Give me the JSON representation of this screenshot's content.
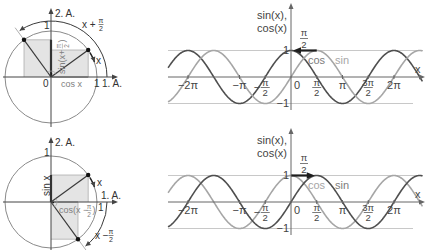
{
  "figure": {
    "top_circle": {
      "axis_x_label": "1. A.",
      "axis_y_label": "2. A.",
      "unit_y_label": "1",
      "unit_x_label": "1",
      "origin_label": "0",
      "angle_label": "x",
      "shifted_angle_prefix": "x +",
      "shifted_angle_num": "π",
      "shifted_angle_den": "2",
      "projection_x_label": "cos x",
      "projection_y_prefix": "sin(x+",
      "projection_y_num": "π",
      "projection_y_den": "2",
      "projection_y_suffix": ")"
    },
    "bottom_circle": {
      "axis_x_label": "1. A.",
      "axis_y_label": "2. A.",
      "unit_y_label": "1",
      "unit_x_label": "1",
      "angle_label": "x",
      "shifted_angle_prefix": "x −",
      "shifted_angle_num": "π",
      "shifted_angle_den": "2",
      "projection_y_label": "sin x",
      "projection_x_prefix": "cos(x −",
      "projection_x_num": "π",
      "projection_x_den": "2",
      "projection_x_suffix": ")"
    }
  },
  "colors": {
    "curve_dark": "#4f4f4f",
    "curve_light": "#a6a6a6",
    "axis": "#444444",
    "grid": "#c8c8c8",
    "shade": "#e4e4e4",
    "annotation_arrow": "#1e1e1e"
  },
  "chart_data": [
    {
      "type": "line",
      "title": "",
      "ylabel": "sin(x), cos(x)",
      "ylabel_lines": [
        "sin(x),",
        "cos(x)"
      ],
      "xlabel": "x",
      "x_range": [
        -7.5,
        8.05
      ],
      "ylim": [
        -1,
        1
      ],
      "grid": {
        "horizontal_lines": [
          1,
          -1
        ]
      },
      "y_ticks": [
        {
          "value": 1,
          "label": "1"
        },
        {
          "value": -1,
          "label": "−1"
        }
      ],
      "x_ticks": [
        {
          "value": -6.2832,
          "label": "−2π"
        },
        {
          "value": -3.1416,
          "label": "−π"
        },
        {
          "value": -1.5708,
          "sign": "−",
          "num": "π",
          "den": "2"
        },
        {
          "value": 0,
          "label": "0"
        },
        {
          "value": 1.5708,
          "num": "π",
          "den": "2"
        },
        {
          "value": 3.1416,
          "label": "π"
        },
        {
          "value": 4.7124,
          "num": "3π",
          "den": "2"
        },
        {
          "value": 6.2832,
          "label": "2π"
        }
      ],
      "series": [
        {
          "name": "cos",
          "function": "cos",
          "label": "cos",
          "color": "#4f4f4f",
          "label_color": "#7c7c7c",
          "x": [
            -6.2832,
            -4.7124,
            -3.1416,
            -1.5708,
            0,
            1.5708,
            3.1416,
            4.7124,
            6.2832
          ],
          "values": [
            1,
            0,
            -1,
            0,
            1,
            0,
            -1,
            0,
            1
          ]
        },
        {
          "name": "sin",
          "function": "sin",
          "label": "sin",
          "color": "#a6a6a6",
          "label_color": "#a6a6a6",
          "x": [
            -6.2832,
            -4.7124,
            -3.1416,
            -1.5708,
            0,
            1.5708,
            3.1416,
            4.7124,
            6.2832
          ],
          "values": [
            0,
            1,
            0,
            -1,
            0,
            1,
            0,
            -1,
            0
          ]
        }
      ],
      "annotation": {
        "type": "arrow",
        "from_x": 1.5708,
        "to_x": 0,
        "y": 1,
        "label_num": "π",
        "label_den": "2",
        "color": "#1e1e1e"
      }
    },
    {
      "type": "line",
      "title": "",
      "ylabel": "sin(x), cos(x)",
      "ylabel_lines": [
        "sin(x),",
        "cos(x)"
      ],
      "xlabel": "x",
      "x_range": [
        -7.5,
        8.05
      ],
      "ylim": [
        -1,
        1
      ],
      "grid": {
        "horizontal_lines": [
          1,
          -1
        ]
      },
      "y_ticks": [
        {
          "value": 1,
          "label": "1"
        },
        {
          "value": -1,
          "label": "−1"
        }
      ],
      "x_ticks": [
        {
          "value": -6.2832,
          "label": "−2π"
        },
        {
          "value": -3.1416,
          "label": "−π"
        },
        {
          "value": -1.5708,
          "sign": "−",
          "num": "π",
          "den": "2"
        },
        {
          "value": 0,
          "label": "0"
        },
        {
          "value": 1.5708,
          "num": "π",
          "den": "2"
        },
        {
          "value": 3.1416,
          "label": "π"
        },
        {
          "value": 4.7124,
          "num": "3π",
          "den": "2"
        },
        {
          "value": 6.2832,
          "label": "2π"
        }
      ],
      "series": [
        {
          "name": "cos",
          "function": "cos",
          "label": "cos",
          "color": "#a6a6a6",
          "label_color": "#a6a6a6",
          "x": [
            -6.2832,
            -4.7124,
            -3.1416,
            -1.5708,
            0,
            1.5708,
            3.1416,
            4.7124,
            6.2832
          ],
          "values": [
            1,
            0,
            -1,
            0,
            1,
            0,
            -1,
            0,
            1
          ]
        },
        {
          "name": "sin",
          "function": "sin",
          "label": "sin",
          "color": "#4f4f4f",
          "label_color": "#7c7c7c",
          "x": [
            -6.2832,
            -4.7124,
            -3.1416,
            -1.5708,
            0,
            1.5708,
            3.1416,
            4.7124,
            6.2832
          ],
          "values": [
            0,
            1,
            0,
            -1,
            0,
            1,
            0,
            -1,
            0
          ]
        }
      ],
      "annotation": {
        "type": "arrow",
        "from_x": 0,
        "to_x": 1.5708,
        "y": 1,
        "label_num": "π",
        "label_den": "2",
        "color": "#1e1e1e"
      }
    }
  ]
}
